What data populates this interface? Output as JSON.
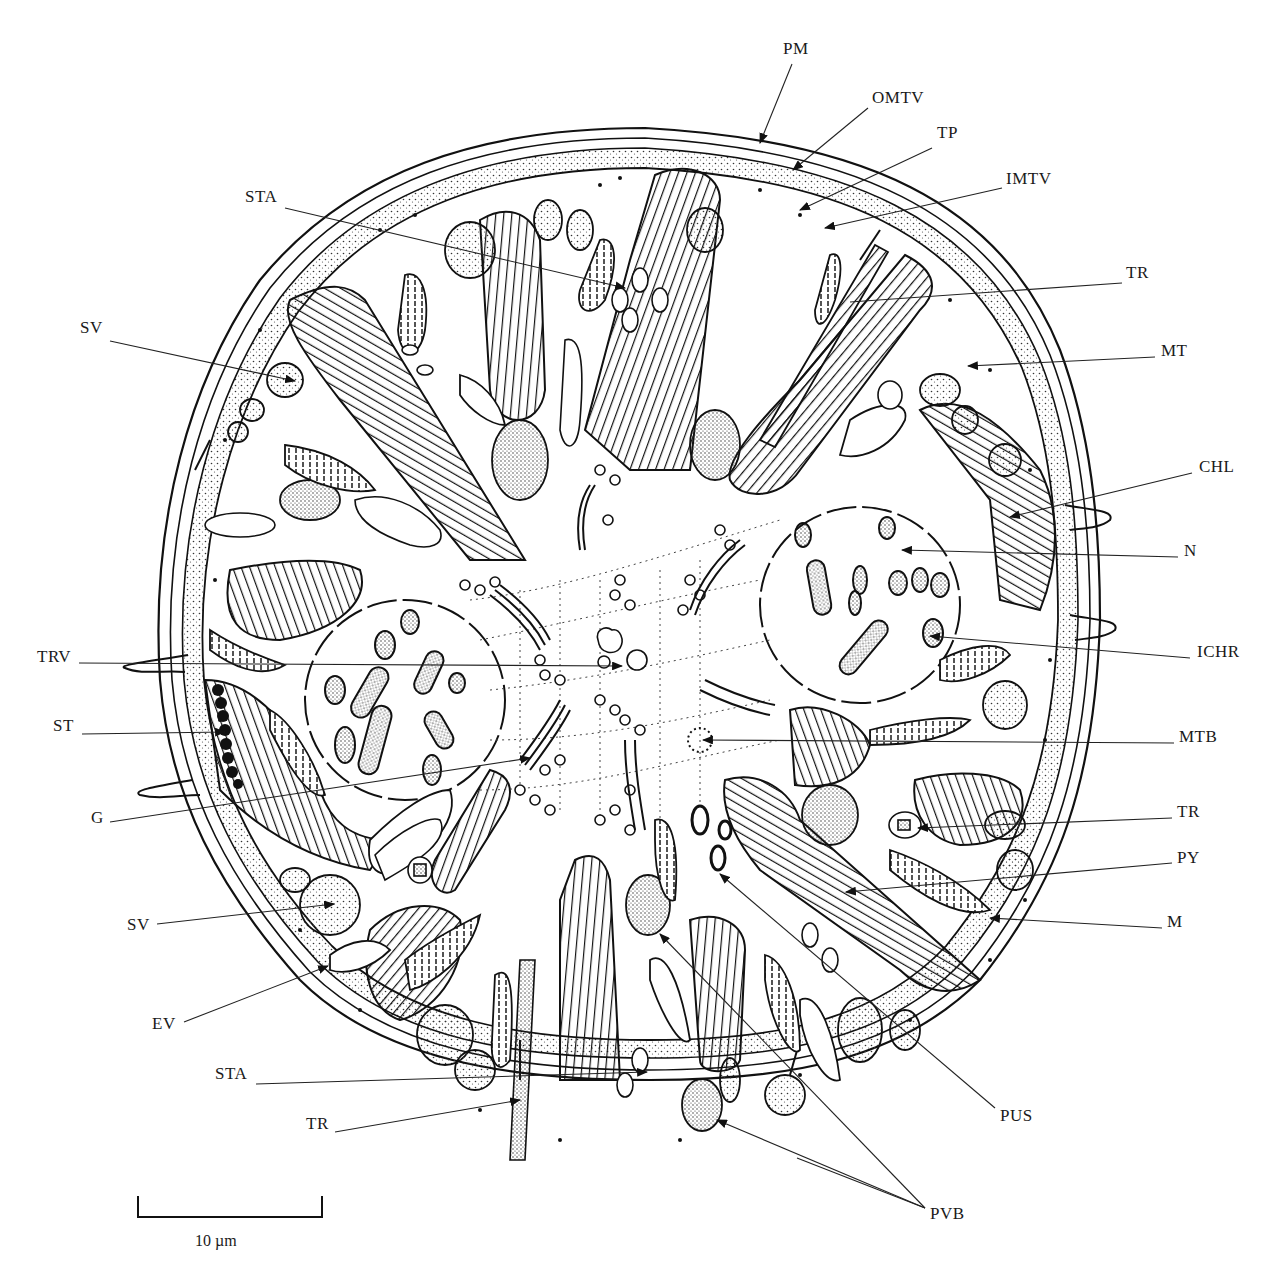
{
  "figure": {
    "type": "cell cross-section diagram",
    "labels": [
      {
        "id": "pm",
        "text": "PM",
        "x": 783,
        "y": 48
      },
      {
        "id": "omtv",
        "text": "OMTV",
        "x": 872,
        "y": 97
      },
      {
        "id": "tp",
        "text": "TP",
        "x": 937,
        "y": 132
      },
      {
        "id": "imtv",
        "text": "IMTV",
        "x": 1006,
        "y": 178
      },
      {
        "id": "tr-top",
        "text": "TR",
        "x": 1126,
        "y": 272
      },
      {
        "id": "mt",
        "text": "MT",
        "x": 1161,
        "y": 350
      },
      {
        "id": "chl",
        "text": "CHL",
        "x": 1199,
        "y": 466
      },
      {
        "id": "n",
        "text": "N",
        "x": 1184,
        "y": 550
      },
      {
        "id": "ichr",
        "text": "ICHR",
        "x": 1197,
        "y": 651
      },
      {
        "id": "mtb",
        "text": "MTB",
        "x": 1179,
        "y": 736
      },
      {
        "id": "tr-right",
        "text": "TR",
        "x": 1177,
        "y": 811
      },
      {
        "id": "py",
        "text": "PY",
        "x": 1177,
        "y": 857
      },
      {
        "id": "m",
        "text": "M",
        "x": 1167,
        "y": 921
      },
      {
        "id": "sta-top",
        "text": "STA",
        "x": 245,
        "y": 196
      },
      {
        "id": "sv-top",
        "text": "SV",
        "x": 80,
        "y": 327
      },
      {
        "id": "trv",
        "text": "TRV",
        "x": 37,
        "y": 656
      },
      {
        "id": "st",
        "text": "ST",
        "x": 53,
        "y": 725
      },
      {
        "id": "g",
        "text": "G",
        "x": 91,
        "y": 817
      },
      {
        "id": "sv-bottom",
        "text": "SV",
        "x": 127,
        "y": 924
      },
      {
        "id": "ev",
        "text": "EV",
        "x": 152,
        "y": 1023
      },
      {
        "id": "sta-bottom",
        "text": "STA",
        "x": 215,
        "y": 1073
      },
      {
        "id": "tr-bottom",
        "text": "TR",
        "x": 306,
        "y": 1123
      },
      {
        "id": "pus",
        "text": "PUS",
        "x": 1000,
        "y": 1115
      },
      {
        "id": "pvb",
        "text": "PVB",
        "x": 930,
        "y": 1213
      }
    ],
    "scale_bar": {
      "label": "10 µm",
      "x1": 138,
      "y1": 1197,
      "x2": 322,
      "y2": 1213
    }
  }
}
